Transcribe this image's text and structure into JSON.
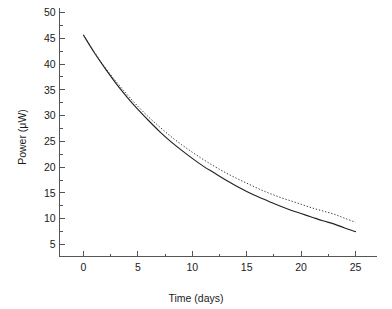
{
  "chart_data": {
    "type": "line",
    "title": "",
    "xlabel": "Time (days)",
    "ylabel": "Power (μW)",
    "xlim": [
      -2.2,
      27.0
    ],
    "ylim": [
      2.6,
      50.8
    ],
    "grid": false,
    "legend": "none",
    "x_ticks": [
      0,
      5,
      10,
      15,
      20,
      25
    ],
    "x_tick_labels": [
      "0",
      "5",
      "10",
      "15",
      "20",
      "25"
    ],
    "x_minor_ticks": [
      2.5,
      7.5,
      12.5,
      17.5,
      22.5
    ],
    "y_ticks": [
      5,
      10,
      15,
      20,
      25,
      30,
      35,
      40,
      45,
      50
    ],
    "y_tick_labels": [
      "5",
      "10",
      "15",
      "20",
      "25",
      "30",
      "35",
      "40",
      "45",
      "50"
    ],
    "y_minor_ticks": [
      7.5,
      12.5,
      17.5,
      22.5,
      27.5,
      32.5,
      37.5,
      42.5,
      47.5
    ],
    "x": [
      0,
      1,
      2,
      3,
      4,
      5,
      6,
      7,
      8,
      9,
      10,
      11,
      12,
      13,
      14,
      15,
      16,
      17,
      18,
      19,
      20,
      21,
      22,
      23,
      24,
      25
    ],
    "series": [
      {
        "name": "solid-curve",
        "style": "solid",
        "color": "#222222",
        "values": [
          45.6,
          42.2,
          39.1,
          36.2,
          33.6,
          31.2,
          29.0,
          26.9,
          25.0,
          23.3,
          21.7,
          20.2,
          18.9,
          17.6,
          16.4,
          15.3,
          14.3,
          13.4,
          12.5,
          11.7,
          11.0,
          10.3,
          9.6,
          9.0,
          8.2,
          7.5
        ]
      },
      {
        "name": "dotted-curve",
        "style": "dotted",
        "color": "#333333",
        "values": [
          45.6,
          42.3,
          39.3,
          36.6,
          34.1,
          31.8,
          29.7,
          27.8,
          26.0,
          24.4,
          22.9,
          21.5,
          20.2,
          19.0,
          17.9,
          16.9,
          15.9,
          15.0,
          14.2,
          13.5,
          12.8,
          12.1,
          11.5,
          10.9,
          10.1,
          9.3
        ]
      }
    ]
  },
  "axes": {
    "x_axis_name": "Time (days)",
    "y_axis_name": "Power (μW)"
  }
}
